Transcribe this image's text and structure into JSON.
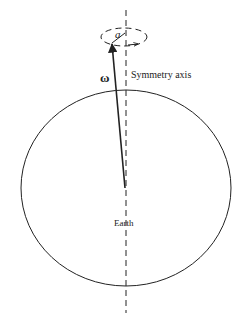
{
  "diagram": {
    "labels": {
      "omega": "ω",
      "a": "a",
      "symmetry_axis": "Symmetry axis",
      "earth": "Earth"
    },
    "colors": {
      "stroke": "#222222",
      "background": "#ffffff"
    }
  }
}
